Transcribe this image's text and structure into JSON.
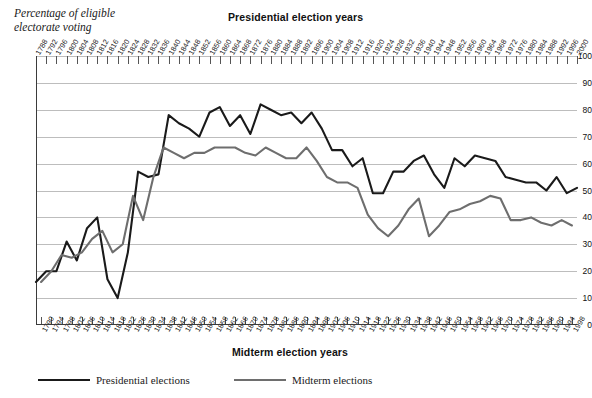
{
  "chart_data": {
    "type": "line",
    "title": "",
    "ylabel": "Percentage of eligible\nelectorate voting",
    "top_axis_title": "Presidential election years",
    "bottom_axis_title": "Midterm election years",
    "ylim": [
      0,
      100
    ],
    "ytick_labels": [
      "100",
      "90",
      "80",
      "70",
      "60",
      "50",
      "40",
      "30",
      "20",
      "10",
      "0"
    ],
    "yticks": [
      100,
      90,
      80,
      70,
      60,
      50,
      40,
      30,
      20,
      10,
      0
    ],
    "grid": true,
    "legend_position": "below-plot-left",
    "colors": {
      "presidential": "#1a1a1a",
      "midterm": "#6e6e6e",
      "axis": "#3b3b3b",
      "gridline": "#bdbdbd",
      "background": "#ffffff"
    },
    "series": [
      {
        "name": "Presidential elections",
        "color": "#1a1a1a",
        "x": [
          1788,
          1792,
          1796,
          1800,
          1804,
          1808,
          1812,
          1816,
          1820,
          1824,
          1828,
          1832,
          1836,
          1840,
          1844,
          1848,
          1852,
          1856,
          1860,
          1864,
          1868,
          1872,
          1876,
          1880,
          1884,
          1888,
          1892,
          1896,
          1900,
          1904,
          1908,
          1912,
          1916,
          1920,
          1924,
          1928,
          1932,
          1936,
          1940,
          1944,
          1948,
          1952,
          1956,
          1960,
          1964,
          1968,
          1972,
          1976,
          1980,
          1984,
          1988,
          1992,
          1996,
          2000
        ],
        "values": [
          16,
          20,
          20,
          31,
          24,
          36,
          40,
          17,
          10,
          27,
          57,
          55,
          56,
          78,
          75,
          73,
          70,
          79,
          81,
          74,
          78,
          71,
          82,
          80,
          78,
          79,
          75,
          79,
          73,
          65,
          65,
          59,
          62,
          49,
          49,
          57,
          57,
          61,
          63,
          56,
          51,
          62,
          59,
          63,
          62,
          61,
          55,
          54,
          53,
          53,
          50,
          55,
          49,
          51
        ]
      },
      {
        "name": "Midterm elections",
        "color": "#6e6e6e",
        "x": [
          1790,
          1794,
          1798,
          1802,
          1806,
          1810,
          1814,
          1818,
          1822,
          1826,
          1830,
          1834,
          1838,
          1842,
          1846,
          1850,
          1854,
          1858,
          1862,
          1866,
          1870,
          1874,
          1878,
          1882,
          1886,
          1890,
          1894,
          1898,
          1902,
          1906,
          1910,
          1914,
          1918,
          1922,
          1926,
          1930,
          1934,
          1938,
          1942,
          1946,
          1950,
          1954,
          1958,
          1962,
          1966,
          1970,
          1974,
          1978,
          1982,
          1986,
          1990,
          1994,
          1998
        ],
        "values": [
          16,
          20,
          26,
          25,
          27,
          32,
          35,
          27,
          30,
          48,
          39,
          55,
          66,
          64,
          62,
          64,
          64,
          66,
          66,
          66,
          64,
          63,
          66,
          64,
          62,
          62,
          66,
          61,
          55,
          53,
          53,
          51,
          41,
          36,
          33,
          37,
          43,
          47,
          33,
          37,
          42,
          43,
          45,
          46,
          48,
          47,
          39,
          39,
          40,
          38,
          37,
          39,
          37
        ]
      }
    ],
    "x_top_ticks": [
      "1788",
      "1792",
      "1796",
      "1800",
      "1804",
      "1808",
      "1812",
      "1816",
      "1820",
      "1824",
      "1828",
      "1832",
      "1836",
      "1840",
      "1844",
      "1848",
      "1852",
      "1856",
      "1860",
      "1864",
      "1868",
      "1872",
      "1876",
      "1880",
      "1884",
      "1888",
      "1892",
      "1896",
      "1900",
      "1904",
      "1908",
      "1912",
      "1916",
      "1920",
      "1924",
      "1928",
      "1932",
      "1936",
      "1940",
      "1944",
      "1948",
      "1952",
      "1956",
      "1960",
      "1964",
      "1968",
      "1972",
      "1976",
      "1980",
      "1984",
      "1988",
      "1992",
      "1996",
      "2000"
    ],
    "x_bottom_ticks": [
      "1790",
      "1794",
      "1798",
      "1802",
      "1806",
      "1810",
      "1814",
      "1818",
      "1822",
      "1826",
      "1830",
      "1834",
      "1838",
      "1842",
      "1846",
      "1850",
      "1854",
      "1858",
      "1862",
      "1866",
      "1870",
      "1874",
      "1878",
      "1882",
      "1886",
      "1890",
      "1894",
      "1898",
      "1902",
      "1906",
      "1910",
      "1914",
      "1918",
      "1922",
      "1926",
      "1930",
      "1934",
      "1938",
      "1942",
      "1946",
      "1950",
      "1954",
      "1958",
      "1962",
      "1966",
      "1970",
      "1974",
      "1978",
      "1982",
      "1986",
      "1990",
      "1994",
      "1998"
    ]
  },
  "legend": {
    "presidential_label": "Presidential elections",
    "midterm_label": "Midterm elections"
  }
}
